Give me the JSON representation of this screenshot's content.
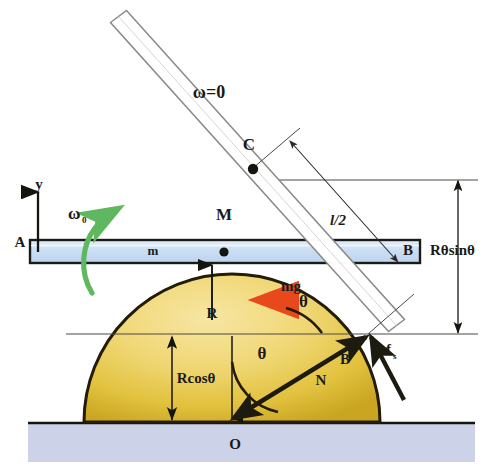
{
  "figure": {
    "background_color": "#ffffff"
  },
  "colors": {
    "hemisphere_fill_light": "#f5e08f",
    "hemisphere_fill_mid": "#e8c94a",
    "hemisphere_fill_dark": "#c9a41f",
    "hemisphere_outline": "#241c08",
    "bar_fill": "#cfe0f2",
    "bar_outline": "#1a1a18",
    "ground_fill": "#ccd2e8",
    "ground_line": "#15150f",
    "weight_arrow": "#f4511e",
    "spin_arrow": "#5fb85f",
    "construction_line": "#4a4a46",
    "force_arrow": "#1d1a10",
    "text": "#1a1a18"
  },
  "labels": {
    "omega_zero_top": "ω=0",
    "point_c": "C",
    "half_length": "l/2",
    "axis_y": "y",
    "omega_initial_base": "ω",
    "omega_initial_sub": "0",
    "point_a": "A",
    "bar_mass": "m",
    "rod_mass": "M",
    "point_b_bar": "B",
    "height_expression": "Rθsinθ",
    "weight": "mg",
    "theta_upper": "θ",
    "radius": "R",
    "theta_lower": "θ",
    "radius_cos": "Rcosθ",
    "normal_force": "N",
    "contact_point_b": "B",
    "friction_base": "f",
    "friction_sub": "s",
    "origin": "O"
  },
  "geometry": {
    "rod": {
      "top_end_x": 118,
      "top_end_y": 16,
      "bottom_end_x": 396,
      "bottom_end_y": 325,
      "width": 22,
      "note": "tilted white rectangle rod, outline only"
    },
    "hemisphere": {
      "center_x": 232,
      "center_y": 422,
      "radius": 148
    },
    "bar": {
      "left_x": 30,
      "right_x": 420,
      "top_y": 240,
      "height": 22
    },
    "ground": {
      "top_y": 422,
      "bottom_y": 462
    },
    "contact_point": {
      "x": 368,
      "y": 334
    },
    "point_c": {
      "x": 253,
      "y": 168
    }
  },
  "annotations": {
    "dimension_lines": [
      {
        "name": "R-theta-sin-theta",
        "orientation": "vertical",
        "from_y": 180,
        "to_y": 334,
        "x": 458
      },
      {
        "name": "R-cos-theta",
        "orientation": "vertical",
        "from_y": 334,
        "to_y": 422,
        "x": 172
      },
      {
        "name": "R",
        "orientation": "vertical",
        "from_y": 318,
        "to_y": 262,
        "x": 212
      },
      {
        "name": "half-length-l-over-2",
        "orientation": "diagonal",
        "note": "along rod perpendicular measure"
      }
    ]
  }
}
